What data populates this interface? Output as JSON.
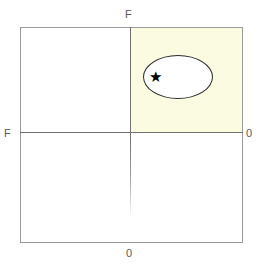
{
  "figure": {
    "name": "two-axis-quadrant-diagram",
    "background_color": "#ffffff",
    "frame_border_color": "#9a9a9a",
    "axis_line_color": "#6f6f6f"
  },
  "axes": {
    "top_label": "F",
    "left_label": "F",
    "right_label": "0",
    "bottom_label": "0",
    "label_color": "#585858"
  },
  "quadrants": {
    "highlighted": {
      "position": "top-right",
      "fill_color": "#fbfbe2"
    }
  },
  "annotations": {
    "ellipse": {
      "shape": "ellipse",
      "fill_color": "#ffffff",
      "stroke_color": "#2b2b2b"
    },
    "marker": {
      "glyph": "★",
      "color": "#000000"
    }
  }
}
